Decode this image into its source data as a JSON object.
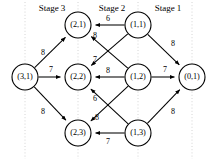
{
  "figure": {
    "type": "network-diagram",
    "title": "",
    "stages": [
      {
        "label": "Stage 3",
        "x": 52,
        "y": 9
      },
      {
        "label": "Stage 2",
        "x": 112,
        "y": 9
      },
      {
        "label": "Stage 1",
        "x": 168,
        "y": 9
      }
    ],
    "grid_lines_x": [
      25,
      78,
      138,
      192
    ],
    "nodes": [
      {
        "id": "3-1",
        "label": "(3,1)",
        "x": 25,
        "y": 77,
        "r": 13
      },
      {
        "id": "2-1",
        "label": "(2,1)",
        "x": 78,
        "y": 25,
        "r": 13
      },
      {
        "id": "2-2",
        "label": "(2,2)",
        "x": 78,
        "y": 77,
        "r": 13
      },
      {
        "id": "2-3",
        "label": "(2,3)",
        "x": 78,
        "y": 133,
        "r": 13
      },
      {
        "id": "1-1",
        "label": "(1,1)",
        "x": 138,
        "y": 25,
        "r": 13
      },
      {
        "id": "1-2",
        "label": "(1,2)",
        "x": 138,
        "y": 77,
        "r": 13
      },
      {
        "id": "1-3",
        "label": "(1,3)",
        "x": 138,
        "y": 133,
        "r": 13
      },
      {
        "id": "0-1",
        "label": "(0,1)",
        "x": 192,
        "y": 77,
        "r": 13
      }
    ],
    "edges": [
      {
        "id": "e-31-21",
        "from": "3-1",
        "to": "2-1",
        "weight": "8",
        "lx": 43,
        "ly": 53
      },
      {
        "id": "e-31-22",
        "from": "3-1",
        "to": "2-2",
        "weight": "7",
        "lx": 51,
        "ly": 70
      },
      {
        "id": "e-31-23",
        "from": "3-1",
        "to": "2-3",
        "weight": "8",
        "lx": 43,
        "ly": 112
      },
      {
        "id": "e-11-21",
        "from": "1-1",
        "to": "2-1",
        "weight": "6",
        "lx": 108,
        "ly": 19
      },
      {
        "id": "e-12-21",
        "from": "1-2",
        "to": "2-1",
        "weight": "8",
        "lx": 95,
        "ly": 36
      },
      {
        "id": "e-11-22",
        "from": "1-1",
        "to": "2-2",
        "weight": "7",
        "lx": 95,
        "ly": 60
      },
      {
        "id": "e-12-22",
        "from": "1-2",
        "to": "2-2",
        "weight": "8",
        "lx": 108,
        "ly": 71
      },
      {
        "id": "e-13-22",
        "from": "1-3",
        "to": "2-2",
        "weight": "6",
        "lx": 95,
        "ly": 99
      },
      {
        "id": "e-12-23",
        "from": "1-2",
        "to": "2-3",
        "weight": "8",
        "lx": 97,
        "ly": 118
      },
      {
        "id": "e-13-23",
        "from": "1-3",
        "to": "2-3",
        "weight": "7",
        "lx": 108,
        "ly": 142
      },
      {
        "id": "e-11-01",
        "from": "1-1",
        "to": "0-1",
        "weight": "8",
        "lx": 173,
        "ly": 44
      },
      {
        "id": "e-12-01",
        "from": "1-2",
        "to": "0-1",
        "weight": "7",
        "lx": 165,
        "ly": 70
      },
      {
        "id": "e-13-01",
        "from": "1-3",
        "to": "0-1",
        "weight": "8",
        "lx": 173,
        "ly": 112
      }
    ],
    "colors": {
      "node_fill": "#ffffff",
      "stroke": "#000000",
      "grid": "#c9c9c9"
    }
  }
}
